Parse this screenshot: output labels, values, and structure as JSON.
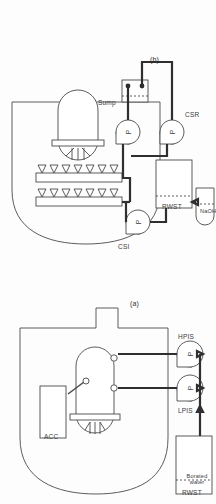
{
  "figure": {
    "kind": "engineering-schematic",
    "orientation": "rotated-90-ccw",
    "panels": [
      {
        "id": "b",
        "caption": "(b)",
        "title_implied": "Containment Spray System",
        "labels": {
          "spray_injection_pump": "CSI",
          "spray_recirc_pump": "CSR",
          "water_tank": "RWST",
          "chemical_tank": "NaOH",
          "sump": "Sump",
          "pump_glyph": "P"
        },
        "components": [
          {
            "name": "containment-building",
            "type": "boundary"
          },
          {
            "name": "spray-header-row-1",
            "type": "spray-header",
            "nozzles": 7
          },
          {
            "name": "spray-header-row-2",
            "type": "spray-header",
            "nozzles": 7
          },
          {
            "name": "reactor-pressure-vessel",
            "type": "vessel"
          },
          {
            "name": "containment-sump",
            "type": "sump",
            "connections": 2
          },
          {
            "name": "csi-pump",
            "type": "pump",
            "label": "CSI"
          },
          {
            "name": "csr-pump",
            "type": "pump",
            "label": "CSR"
          },
          {
            "name": "rwst-tank",
            "type": "tank",
            "label": "RWST"
          },
          {
            "name": "naoh-tank",
            "type": "tank",
            "label": "NaOH"
          }
        ]
      },
      {
        "id": "a",
        "caption": "(a)",
        "title_implied": "Emergency Core Cooling System",
        "labels": {
          "low_pressure_system": "LPIS",
          "high_pressure_system": "HPIS",
          "accumulator": "ACC",
          "tank_name": "RWST",
          "tank_contents": "Borated water",
          "pump_glyph": "P"
        },
        "components": [
          {
            "name": "containment-building",
            "type": "boundary"
          },
          {
            "name": "accumulator-box",
            "type": "tank",
            "label": "ACC"
          },
          {
            "name": "reactor-pressure-vessel",
            "type": "vessel"
          },
          {
            "name": "lpis-pump",
            "type": "pump",
            "label": "LPIS"
          },
          {
            "name": "hpis-pump",
            "type": "pump",
            "label": "HPIS"
          },
          {
            "name": "rwst-tank",
            "type": "tank",
            "label": "RWST"
          }
        ]
      }
    ]
  },
  "colors": {
    "background": "#fdfdfd",
    "line": "#4a4a4a",
    "line_heavy": "#2f2f2f",
    "text": "#3b3b3b"
  }
}
